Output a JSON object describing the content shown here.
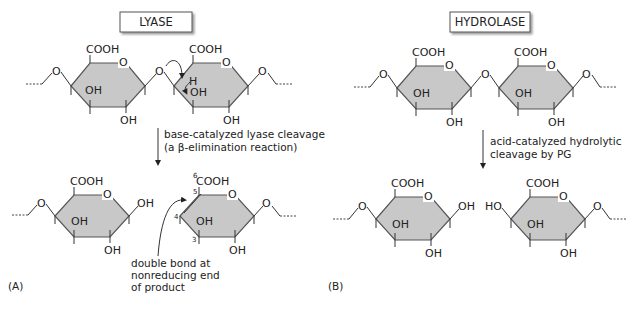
{
  "panels": {
    "a": {
      "title": "LYASE",
      "label": "(A)",
      "reaction_caption_line1": "base-catalyzed lyase cleavage",
      "reaction_caption_line2": "(a β-elimination reaction)",
      "annotation_line1": "double bond at",
      "annotation_line2": "nonreducing end",
      "annotation_line3": "of product",
      "atom_numbers": {
        "c6": "6",
        "c5": "5",
        "c4": "4",
        "c3": "3"
      },
      "hydrogen_label": "H"
    },
    "b": {
      "title": "HYDROLASE",
      "label": "(B)",
      "reaction_caption_line1": "acid-catalyzed hydrolytic",
      "reaction_caption_line2": "cleavage by PG"
    }
  },
  "groups": {
    "carboxyl": "COOH",
    "hydroxyl": "OH",
    "hydroxyl_left": "HO",
    "ring_oxygen": "O",
    "bridge_oxygen": "O"
  },
  "colors": {
    "ring_fill": "#c8c8c8",
    "ring_stroke": "#555555",
    "text": "#222222"
  }
}
